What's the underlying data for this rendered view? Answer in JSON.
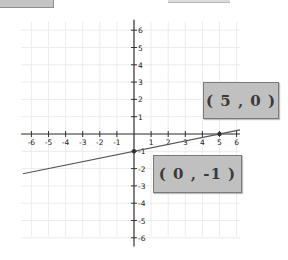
{
  "chart_data": {
    "type": "line",
    "title": "",
    "xlabel": "",
    "ylabel": "",
    "xlim": [
      -6.5,
      6.2
    ],
    "ylim": [
      -6.5,
      6.5
    ],
    "grid": true,
    "x_ticks": [
      -6,
      -5,
      -4,
      -3,
      -2,
      -1,
      1,
      2,
      3,
      4,
      5,
      6
    ],
    "y_ticks": [
      6,
      5,
      4,
      3,
      2,
      1,
      -1,
      -2,
      -3,
      -4,
      -5,
      -6
    ],
    "series": [
      {
        "name": "line",
        "equation": "y = x/5 - 1",
        "slope": 0.2,
        "intercept": -1,
        "x": [
          -6.5,
          6.2
        ],
        "y": [
          -2.3,
          0.24
        ]
      }
    ],
    "points": [
      {
        "x": 5,
        "y": 0,
        "label": "( 5 , 0 )"
      },
      {
        "x": 0,
        "y": -1,
        "label": "( 0 , -1 )"
      }
    ],
    "annotations": [
      "( 5 , 0 )",
      "( 0 , -1 )"
    ]
  },
  "labels": {
    "point_a": "( 5 , 0 )",
    "point_b": "( 0 , -1 )"
  },
  "colors": {
    "axis": "#333333",
    "line": "#555555",
    "grid": "#ececec",
    "label_box": "#c0c0c0",
    "label_border": "#7a7a7a",
    "label_text": "#3a3a3a"
  }
}
